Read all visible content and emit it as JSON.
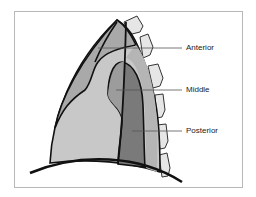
{
  "diagram": {
    "labels": [
      {
        "id": "anterior",
        "text": "Anterior"
      },
      {
        "id": "middle",
        "text": "Middle"
      },
      {
        "id": "posterior",
        "text": "Posterior"
      }
    ],
    "colors": {
      "outline": "#111111",
      "anterior_fill": "#a9a9a9",
      "middle_fill": "#c8c8c8",
      "heart_fill": "#9c9c9c",
      "posterior_fill": "#7a7a7a",
      "paravertebral_fill": "#b5b5b5",
      "vertebra_fill": "#e6e6e6",
      "leader_line": "#555555",
      "frame": "#b8b8b8"
    }
  }
}
